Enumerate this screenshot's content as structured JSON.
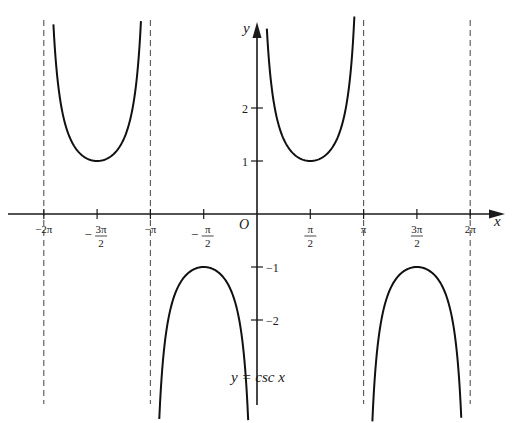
{
  "chart_data": {
    "type": "line",
    "title": "y = csc x",
    "function": "csc",
    "xlabel": "x",
    "ylabel": "y",
    "origin_label": "O",
    "xlim": [
      -6.5,
      7.6
    ],
    "ylim": [
      -3.6,
      3.6
    ],
    "x_ticks": [
      {
        "value": -6.2832,
        "label": "−2π",
        "num": "",
        "den": ""
      },
      {
        "value": -4.7124,
        "label": "−3π/2",
        "num": "3π",
        "den": "2",
        "sign": "−"
      },
      {
        "value": -3.1416,
        "label": "−π",
        "num": "",
        "den": ""
      },
      {
        "value": -1.5708,
        "label": "−π/2",
        "num": "π",
        "den": "2",
        "sign": "−"
      },
      {
        "value": 1.5708,
        "label": "π/2",
        "num": "π",
        "den": "2",
        "sign": ""
      },
      {
        "value": 3.1416,
        "label": "π",
        "num": "",
        "den": ""
      },
      {
        "value": 4.7124,
        "label": "3π/2",
        "num": "3π",
        "den": "2",
        "sign": ""
      },
      {
        "value": 6.2832,
        "label": "2π",
        "num": "",
        "den": ""
      }
    ],
    "y_ticks": [
      {
        "value": 2,
        "label": "2"
      },
      {
        "value": 1,
        "label": "1"
      },
      {
        "value": -1,
        "label": "−1"
      },
      {
        "value": -2,
        "label": "−2"
      }
    ],
    "asymptotes": [
      -6.2832,
      -3.1416,
      3.1416,
      6.2832
    ],
    "asymptote_style": "dashed",
    "series": [
      {
        "name": "csc x on (−2π, −π)",
        "x_range": [
          -6.0,
          -3.42
        ],
        "extremum": {
          "x": -4.7124,
          "y": 1
        }
      },
      {
        "name": "csc x on (−π, 0)",
        "x_range": [
          -2.88,
          -0.26
        ],
        "extremum": {
          "x": -1.5708,
          "y": -1
        }
      },
      {
        "name": "csc x on (0, π)",
        "x_range": [
          0.29,
          2.87
        ],
        "extremum": {
          "x": 1.5708,
          "y": 1
        }
      },
      {
        "name": "csc x on (π, 2π)",
        "x_range": [
          3.4,
          6.02
        ],
        "extremum": {
          "x": 4.7124,
          "y": -1
        }
      }
    ],
    "grid": false,
    "legend": "none",
    "annotation": "y = csc x"
  }
}
